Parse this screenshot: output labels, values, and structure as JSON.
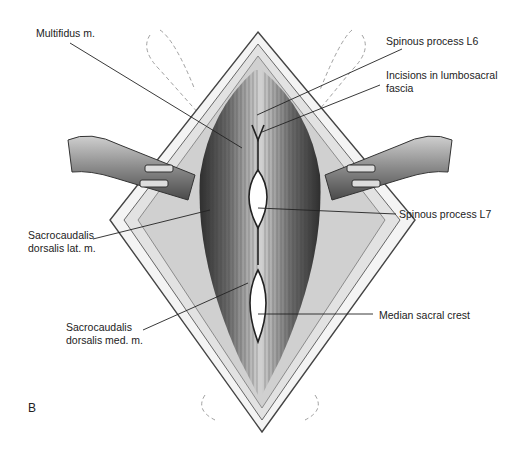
{
  "figure": {
    "panel_letter": "B",
    "labels": {
      "multifidus": "Multifidus m.",
      "spinous_l6": "Spinous process L6",
      "incisions_line1": "Incisions in lumbosacral",
      "incisions_line2": "fascia",
      "sacro_lat_line1": "Sacrocaudalis",
      "sacro_lat_line2": "dorsalis lat. m.",
      "spinous_l7": "Spinous process L7",
      "sacro_med_line1": "Sacrocaudalis",
      "sacro_med_line2": "dorsalis med. m.",
      "median_sacral_crest": "Median sacral crest"
    },
    "colors": {
      "line": "#222222",
      "muscle_dark": "#3a3a3a",
      "muscle_mid": "#8a8a8a",
      "fascia": "#d8d8d8",
      "background": "#ffffff"
    }
  }
}
